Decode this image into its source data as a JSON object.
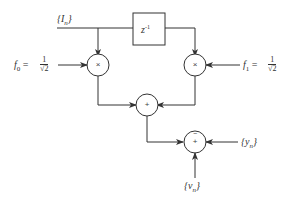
{
  "diagram": {
    "input_label": "{I_n}",
    "input_text": "{I",
    "input_sub": "n",
    "input_close": "}",
    "delay_block": {
      "label": "z",
      "exp": "-1"
    },
    "coef0": {
      "name": "f",
      "sub": "0",
      "eq": "=",
      "num": "1",
      "den": "√2"
    },
    "coef1": {
      "name": "f",
      "sub": "1",
      "eq": "=",
      "num": "1",
      "den": "√2"
    },
    "mult0_symbol": "×",
    "mult1_symbol": "×",
    "sum1_symbol": "+",
    "sum2_symbol": "+",
    "sum2_minus": "−",
    "output_y": {
      "open": "{y",
      "sub": "n",
      "close": "}"
    },
    "noise_v": {
      "open": "{v",
      "sub": "n",
      "close": "}"
    }
  },
  "colors": {
    "stroke": "#333333",
    "background": "#ffffff"
  }
}
